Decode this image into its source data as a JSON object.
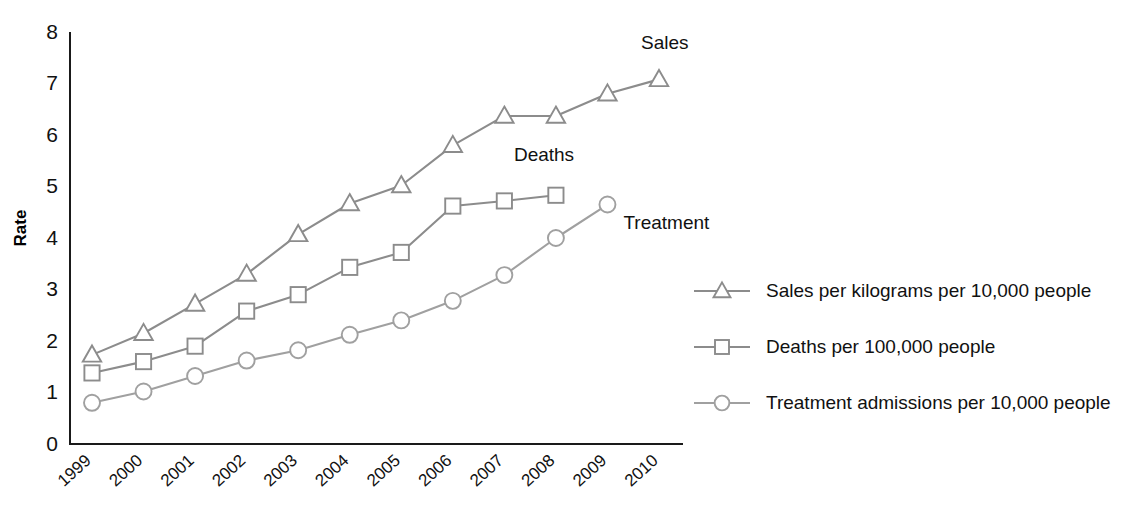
{
  "chart_data": {
    "type": "line",
    "title": "",
    "xlabel": "",
    "ylabel": "Rate",
    "categories": [
      "1999",
      "2000",
      "2001",
      "2002",
      "2003",
      "2004",
      "2005",
      "2006",
      "2007",
      "2008",
      "2009",
      "2010"
    ],
    "ylim": [
      0,
      8
    ],
    "y_ticks": [
      "0",
      "1",
      "2",
      "3",
      "4",
      "5",
      "6",
      "7",
      "8"
    ],
    "grid": false,
    "legend_position": "right",
    "series": [
      {
        "name": "Sales per kilograms per 10,000 people",
        "short_name": "Sales",
        "marker": "triangle",
        "color": "#8c8c8c",
        "values": [
          1.73,
          2.15,
          2.72,
          3.3,
          4.07,
          4.67,
          5.02,
          5.8,
          6.37,
          6.37,
          6.8,
          7.08
        ]
      },
      {
        "name": "Deaths per 100,000 people",
        "short_name": "Deaths",
        "marker": "square",
        "color": "#8c8c8c",
        "values": [
          1.38,
          1.6,
          1.9,
          2.58,
          2.9,
          3.43,
          3.72,
          4.62,
          4.72,
          4.83,
          null,
          null
        ]
      },
      {
        "name": "Treatment admissions per 10,000 people",
        "short_name": "Treatment",
        "marker": "circle",
        "color": "#a0a0a0",
        "values": [
          0.8,
          1.02,
          1.32,
          1.62,
          1.82,
          2.12,
          2.4,
          2.78,
          3.28,
          4.0,
          4.65,
          null
        ]
      }
    ],
    "annotations": [
      {
        "text": "Sales",
        "series": "Sales"
      },
      {
        "text": "Deaths",
        "series": "Deaths"
      },
      {
        "text": "Treatment",
        "series": "Treatment"
      }
    ]
  },
  "colors": {
    "axis": "#1a1a1a",
    "text": "#111111",
    "background": "#ffffff",
    "series_sales": "#8c8c8c",
    "series_deaths": "#8c8c8c",
    "series_treatment": "#a0a0a0"
  }
}
